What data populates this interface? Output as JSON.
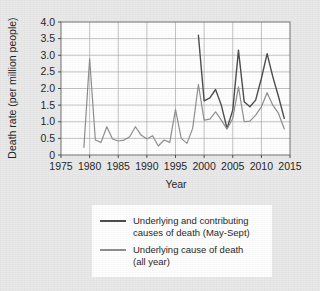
{
  "chart_data": {
    "type": "line",
    "title": "",
    "xlabel": "Year",
    "ylabel": "Death rate (per million people)",
    "xlim": [
      1975,
      2015
    ],
    "ylim": [
      0,
      4.0
    ],
    "xticks": [
      "1975",
      "1980",
      "1985",
      "1990",
      "1995",
      "2000",
      "2005",
      "2010",
      "2015"
    ],
    "xtick_values": [
      1975,
      1980,
      1985,
      1990,
      1995,
      2000,
      2005,
      2010,
      2015
    ],
    "yticks": [
      "0",
      "0.5",
      "1.0",
      "1.5",
      "2.0",
      "2.5",
      "3.0",
      "3.5",
      "4.0"
    ],
    "ytick_values": [
      0,
      0.5,
      1.0,
      1.5,
      2.0,
      2.5,
      3.0,
      3.5,
      4.0
    ],
    "grid": true,
    "legend_position": "below-axes",
    "series": [
      {
        "name": "Underlying and contributing causes of death (May-Sept)",
        "color": "#4a4a4a",
        "x": [
          1999,
          2000,
          2001,
          2002,
          2003,
          2004,
          2005,
          2006,
          2007,
          2008,
          2009,
          2010,
          2011,
          2012,
          2013,
          2014
        ],
        "values": [
          3.6,
          1.63,
          1.72,
          1.97,
          1.5,
          0.8,
          1.35,
          3.15,
          1.6,
          1.45,
          1.65,
          2.3,
          3.05,
          2.35,
          1.75,
          1.1
        ]
      },
      {
        "name": "Underlying cause of death (all year)",
        "color": "#8d8d8d",
        "x": [
          1979,
          1980,
          1981,
          1982,
          1983,
          1984,
          1985,
          1986,
          1987,
          1988,
          1989,
          1990,
          1991,
          1992,
          1993,
          1994,
          1995,
          1996,
          1997,
          1998,
          1999,
          2000,
          2001,
          2002,
          2003,
          2004,
          2005,
          2006,
          2007,
          2008,
          2009,
          2010,
          2011,
          2012,
          2013,
          2014
        ],
        "values": [
          0.23,
          2.9,
          0.45,
          0.38,
          0.85,
          0.48,
          0.42,
          0.45,
          0.55,
          0.85,
          0.6,
          0.48,
          0.58,
          0.27,
          0.45,
          0.38,
          1.37,
          0.5,
          0.35,
          0.8,
          2.12,
          1.05,
          1.08,
          1.3,
          1.05,
          0.78,
          1.1,
          2.05,
          1.0,
          1.02,
          1.2,
          1.45,
          1.87,
          1.5,
          1.25,
          0.78
        ]
      }
    ]
  },
  "legend": {
    "items": [
      {
        "line1": "Underlying and contributing",
        "line2": "causes of death (May-Sept)",
        "color": "#4a4a4a"
      },
      {
        "line1": "Underlying cause of death",
        "line2": "(all year)",
        "color": "#8d8d8d"
      }
    ]
  }
}
